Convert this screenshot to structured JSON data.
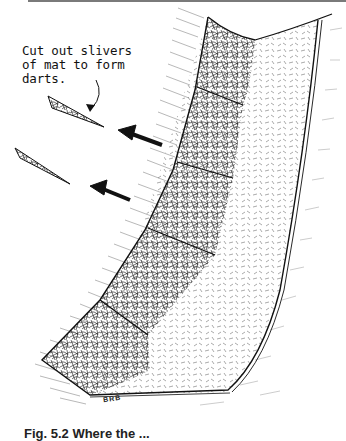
{
  "figure": {
    "annotation": "Cut out slivers\nof mat to form\ndarts.",
    "signature": "BRB",
    "caption": "Fig. 5.2   Where the ...",
    "colors": {
      "ink": "#111111",
      "paper": "#ffffff",
      "top_rule": "#7a7a7a"
    }
  }
}
